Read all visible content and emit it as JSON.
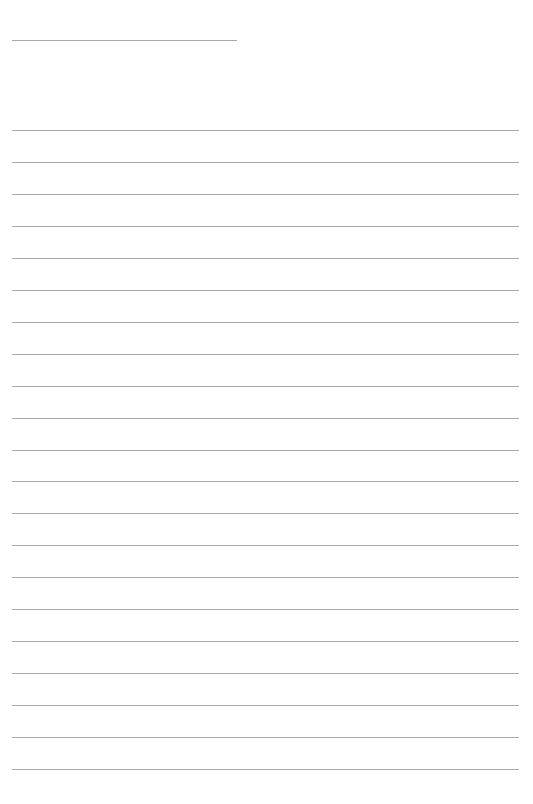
{
  "page": {
    "type": "lined-paper",
    "background_color": "#ffffff",
    "line_color": "#a8a8a8"
  },
  "header_line": {
    "x": 12,
    "y": 40,
    "length": 225
  },
  "ruled_lines": {
    "count": 21,
    "first_y": 130,
    "spacing": 31.95,
    "x": 12,
    "length": 507
  }
}
